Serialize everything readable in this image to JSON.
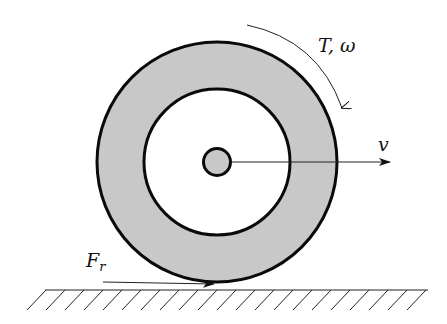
{
  "diagram": {
    "labels": {
      "torque_omega": "T, ω",
      "velocity": "v",
      "friction_main": "F",
      "friction_sub": "r"
    },
    "colors": {
      "fill": "#c8c8c8",
      "stroke": "#0a0a0a",
      "background": "#ffffff"
    }
  }
}
